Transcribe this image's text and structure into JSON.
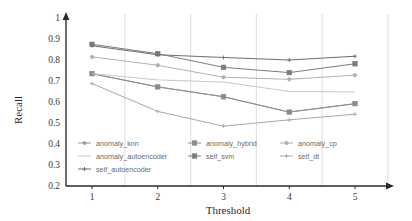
{
  "chart_data": {
    "type": "line",
    "title": "",
    "xlabel": "Threshold",
    "ylabel": "Recall",
    "x": [
      1,
      2,
      3,
      4,
      5
    ],
    "xtick_labels": [
      "1",
      "2",
      "3",
      "4",
      "5"
    ],
    "ytick_labels": [
      "0.2",
      "0.3",
      "0.4",
      "0.5",
      "0.6",
      "0.7",
      "0.8",
      "0.9",
      "1"
    ],
    "ytick_values": [
      0.2,
      0.3,
      0.4,
      0.5,
      0.6,
      0.7,
      0.8,
      0.9,
      1.0
    ],
    "xlim": [
      0.6,
      5.6
    ],
    "ylim": [
      0.2,
      1.0
    ],
    "grid": "vertical",
    "legend_position": "inside-bottom-left",
    "series": [
      {
        "name": "anomaly_knn",
        "color": "#9a9a9a",
        "marker": "diamond",
        "values": [
          0.735,
          0.672,
          0.625,
          0.552,
          0.592
        ]
      },
      {
        "name": "anomaly_hybrid",
        "color": "#8c8c8c",
        "marker": "square",
        "values": [
          0.735,
          0.672,
          0.625,
          0.552,
          0.592
        ]
      },
      {
        "name": "anomaly_cp",
        "color": "#b0b0b0",
        "marker": "circle",
        "values": [
          0.815,
          0.775,
          0.718,
          0.708,
          0.728
        ]
      },
      {
        "name": "anomaly_autoencoder",
        "color": "#c9c9c9",
        "marker": "none",
        "values": [
          0.735,
          0.705,
          0.695,
          0.65,
          0.648
        ]
      },
      {
        "name": "self_svm",
        "color": "#7d7d7d",
        "marker": "square",
        "values": [
          0.875,
          0.83,
          0.765,
          0.74,
          0.782
        ]
      },
      {
        "name": "self_dt",
        "color": "#a8a8a8",
        "marker": "plus",
        "values": [
          0.688,
          0.555,
          0.485,
          0.515,
          0.542
        ]
      },
      {
        "name": "self_autoencoder",
        "color": "#6e6e6e",
        "marker": "plus",
        "values": [
          0.868,
          0.825,
          0.812,
          0.8,
          0.818
        ]
      }
    ],
    "legend_entries": [
      {
        "label": "anomaly_knn",
        "color": "#9a9a9a",
        "marker": "diamond"
      },
      {
        "label": "anomaly_hybrid",
        "color": "#8c8c8c",
        "marker": "square"
      },
      {
        "label": "anomaly_cp",
        "color": "#b0b0b0",
        "marker": "circle"
      },
      {
        "label": "anomaly_autoencoder",
        "color": "#c9c9c9",
        "marker": "none"
      },
      {
        "label": "self_svm",
        "color": "#7d7d7d",
        "marker": "square"
      },
      {
        "label": "self_dt",
        "color": "#a8a8a8",
        "marker": "plus"
      },
      {
        "label": "self_autoencoder",
        "color": "#6e6e6e",
        "marker": "plus"
      }
    ]
  },
  "axes": {
    "y_label": "Recall",
    "x_label": "Threshold"
  }
}
